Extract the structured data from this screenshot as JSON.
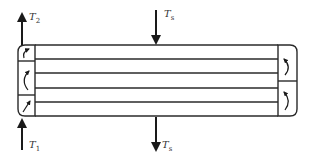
{
  "diagram": {
    "type": "multi-pass heat exchanger schematic",
    "colors": {
      "stroke": "#2a2a2a",
      "background": "#ffffff",
      "text": "#333333"
    },
    "labels": {
      "inlet_tube": {
        "main": "T",
        "sub": "1"
      },
      "outlet_tube": {
        "main": "T",
        "sub": "2"
      },
      "shell_in": {
        "main": "T",
        "sub": "s"
      },
      "shell_out": {
        "main": "T",
        "sub": "s"
      }
    },
    "tube_lines_count": 6,
    "left_header_chambers": 3,
    "right_header_chambers": 2,
    "arrows": {
      "inlet": "up-arrow",
      "outlet": "up-arrow",
      "shell_inlet": "down-arrow",
      "shell_outlet": "down-arrow"
    }
  }
}
